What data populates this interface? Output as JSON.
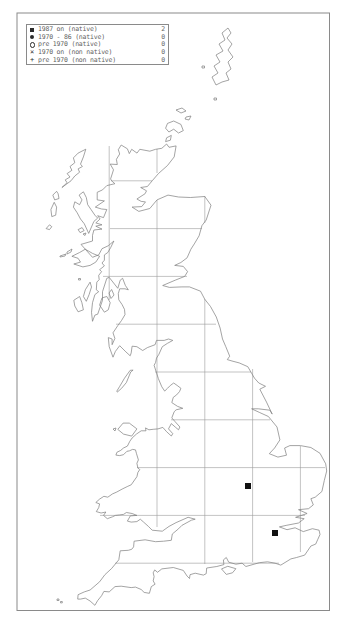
{
  "map": {
    "title": "UK distribution map",
    "legend": {
      "entries": [
        {
          "symbol": "filled-square",
          "label": "1987 on (native)",
          "count": "2"
        },
        {
          "symbol": "filled-circle",
          "label": "1970 - 86 (native)",
          "count": "0"
        },
        {
          "symbol": "open-circle",
          "label": "pre 1970 (native)",
          "count": "0"
        },
        {
          "symbol": "x-cross",
          "label": "1970 on (non native)",
          "count": "0"
        },
        {
          "symbol": "plus",
          "label": "pre 1970 (non native)",
          "count": "0"
        }
      ]
    },
    "records": [
      {
        "symbol": "filled-square",
        "category": "1987 on (native)",
        "x": 248,
        "y": 486
      },
      {
        "symbol": "filled-square",
        "category": "1987 on (native)",
        "x": 275,
        "y": 533
      }
    ],
    "colors": {
      "coastline": "#7d7d7d",
      "grid": "#9b9b9b",
      "border": "#8a8a8a",
      "marker": "#111111",
      "legend_text": "#5f5f5f",
      "background": "#ffffff"
    }
  }
}
